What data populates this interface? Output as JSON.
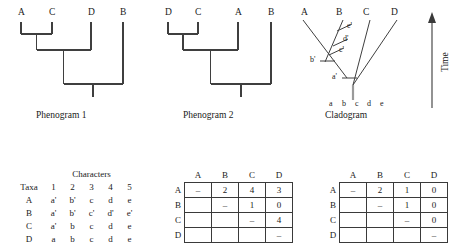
{
  "figure": {
    "panels": [
      {
        "id": "phenogram-1",
        "caption": "Phenogram 1",
        "tip_labels": [
          "A",
          "C",
          "D",
          "B"
        ]
      },
      {
        "id": "phenogram-2",
        "caption": "Phenogram 2",
        "tip_labels": [
          "D",
          "C",
          "A",
          "B"
        ]
      },
      {
        "id": "cladogram",
        "caption": "Cladogram",
        "tip_labels": [
          "A",
          "B",
          "C",
          "D"
        ],
        "character_state_marks": [
          "e'",
          "d'",
          "c'",
          "b'",
          "a'"
        ],
        "ancestral_states": [
          "a",
          "b",
          "c",
          "d",
          "e"
        ],
        "axis_label": "Time"
      }
    ]
  },
  "character_table": {
    "title": "Characters",
    "taxa_header": "Taxa",
    "character_headers": [
      "1",
      "2",
      "3",
      "4",
      "5"
    ],
    "rows": [
      {
        "taxon": "A",
        "states": [
          "a'",
          "b'",
          "c",
          "d",
          "e"
        ]
      },
      {
        "taxon": "B",
        "states": [
          "a'",
          "b'",
          "c'",
          "d'",
          "e'"
        ]
      },
      {
        "taxon": "C",
        "states": [
          "a'",
          "b",
          "c",
          "d",
          "e"
        ]
      },
      {
        "taxon": "D",
        "states": [
          "a",
          "b",
          "c",
          "d",
          "e"
        ]
      }
    ]
  },
  "matrix_middle": {
    "col_headers": [
      "A",
      "B",
      "C",
      "D"
    ],
    "row_headers": [
      "A",
      "B",
      "C",
      "D"
    ],
    "cells": [
      [
        "–",
        "2",
        "4",
        "3"
      ],
      [
        "",
        "–",
        "1",
        "0"
      ],
      [
        "",
        "",
        "–",
        "4"
      ],
      [
        "",
        "",
        "",
        "–"
      ]
    ]
  },
  "matrix_right": {
    "col_headers": [
      "A",
      "B",
      "C",
      "D"
    ],
    "row_headers": [
      "A",
      "B",
      "C",
      "D"
    ],
    "cells": [
      [
        "–",
        "2",
        "1",
        "0"
      ],
      [
        "",
        "–",
        "1",
        "0"
      ],
      [
        "",
        "",
        "–",
        "0"
      ],
      [
        "",
        "",
        "",
        "–"
      ]
    ]
  },
  "style": {
    "line_color": "#3f3f3f",
    "text_color": "#1a1a1a",
    "background": "#ffffff"
  }
}
